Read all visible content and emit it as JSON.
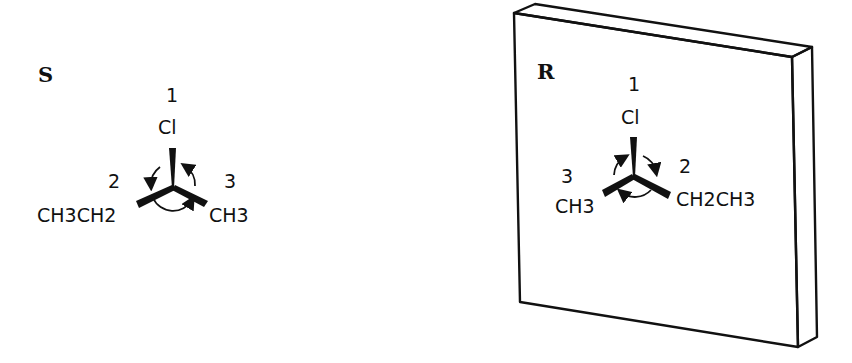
{
  "left_molecule": {
    "configuration": "S",
    "top": {
      "priority": "1",
      "group": "Cl"
    },
    "left": {
      "priority": "2",
      "group": "CH3CH2"
    },
    "right": {
      "priority": "3",
      "group": "CH3"
    },
    "rotation": "counterclockwise"
  },
  "mirror": {
    "label": "mirror plane"
  },
  "right_molecule": {
    "configuration": "R",
    "top": {
      "priority": "1",
      "group": "Cl"
    },
    "left": {
      "priority": "3",
      "group": "CH3"
    },
    "right": {
      "priority": "2",
      "group": "CH2CH3"
    },
    "rotation": "clockwise"
  },
  "colors": {
    "ink": "#111111",
    "background": "#ffffff"
  }
}
